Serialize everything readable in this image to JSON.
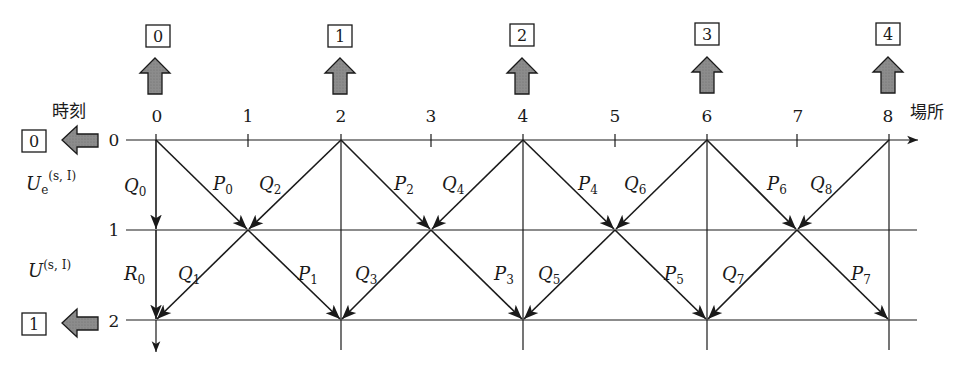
{
  "diagram": {
    "x_axis_label": "場所",
    "y_axis_label": "時刻",
    "x_ticks": [
      "0",
      "1",
      "2",
      "3",
      "4",
      "5",
      "6",
      "7",
      "8"
    ],
    "y_ticks": [
      "0",
      "1",
      "2"
    ],
    "top_boxes": [
      "0",
      "1",
      "2",
      "3",
      "4"
    ],
    "left_boxes": [
      "0",
      "1"
    ],
    "row_labels": {
      "ue": {
        "main": "U",
        "sub": "e",
        "sup": "(s, I)"
      },
      "u": {
        "main": "U",
        "sup": "(s, I)"
      }
    },
    "vertical_labels": [
      {
        "main": "Q",
        "sub": "0"
      },
      {
        "main": "R",
        "sub": "0"
      }
    ],
    "upper_labels": [
      {
        "main": "P",
        "sub": "0"
      },
      {
        "main": "Q",
        "sub": "2"
      },
      {
        "main": "P",
        "sub": "2"
      },
      {
        "main": "Q",
        "sub": "4"
      },
      {
        "main": "P",
        "sub": "4"
      },
      {
        "main": "Q",
        "sub": "6"
      },
      {
        "main": "P",
        "sub": "6"
      },
      {
        "main": "Q",
        "sub": "8"
      }
    ],
    "lower_labels": [
      {
        "main": "Q",
        "sub": "1"
      },
      {
        "main": "P",
        "sub": "1"
      },
      {
        "main": "Q",
        "sub": "3"
      },
      {
        "main": "P",
        "sub": "3"
      },
      {
        "main": "Q",
        "sub": "5"
      },
      {
        "main": "P",
        "sub": "5"
      },
      {
        "main": "Q",
        "sub": "7"
      },
      {
        "main": "P",
        "sub": "7"
      }
    ],
    "colors": {
      "line": "#1a1a1a",
      "arrow_fill": "#8c8c8c"
    }
  }
}
